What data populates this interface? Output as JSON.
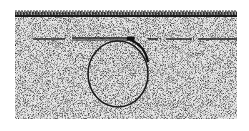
{
  "figure": {
    "background_color": "#ffffff",
    "soil": {
      "x": 15,
      "y": 11,
      "width": 222,
      "height": 108,
      "stipple_color": "#3a3a3a",
      "base_color": "#e6e6e6"
    },
    "grass": {
      "y_top": 9,
      "y_bottom": 17,
      "color": "#1a1a1a"
    },
    "horizon_line": {
      "y": 39,
      "color": "#1e1e1e",
      "segments": [
        {
          "x1": 33,
          "x2": 65
        },
        {
          "x1": 72,
          "x2": 135,
          "style": "double"
        },
        {
          "x1": 148,
          "x2": 158
        },
        {
          "x1": 166,
          "x2": 192
        },
        {
          "x1": 198,
          "x2": 237
        }
      ]
    },
    "burrow": {
      "cx": 118,
      "cy": 73,
      "rx": 31,
      "ry": 34,
      "stroke": "#1a1a1a",
      "stroke_width": 1.6
    }
  }
}
